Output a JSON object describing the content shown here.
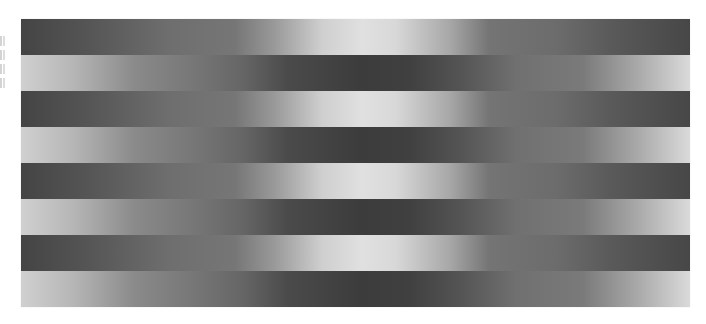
{
  "image": {
    "description": "Horizontal striped grayscale gradient illusion: alternating bands with opposing luminance gradients",
    "band_count": 8,
    "bands": [
      {
        "index": 0,
        "pattern": "dark-edges-light-center"
      },
      {
        "index": 1,
        "pattern": "light-edges-dark-center"
      },
      {
        "index": 2,
        "pattern": "dark-edges-light-center"
      },
      {
        "index": 3,
        "pattern": "light-edges-dark-center"
      },
      {
        "index": 4,
        "pattern": "dark-edges-light-center"
      },
      {
        "index": 5,
        "pattern": "light-edges-dark-center"
      },
      {
        "index": 6,
        "pattern": "dark-edges-light-center"
      },
      {
        "index": 7,
        "pattern": "light-edges-dark-center"
      }
    ],
    "colors": {
      "darkest": "#3c3c3c",
      "mid_gray": "#747474",
      "lightest": "#e0e0e0",
      "background": "#ffffff"
    },
    "edge_text_fragments": 4
  }
}
